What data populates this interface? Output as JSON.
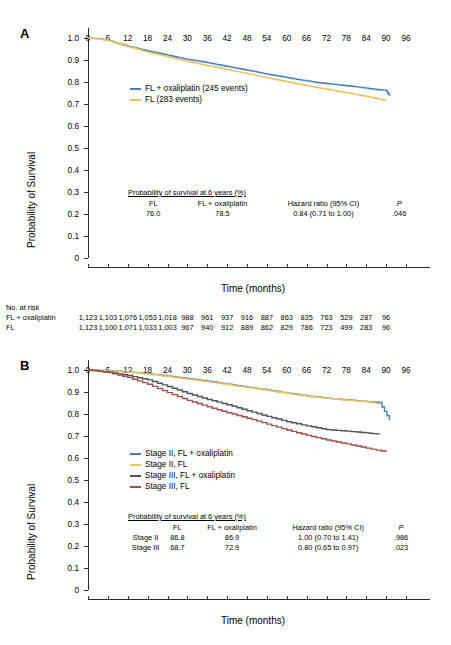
{
  "figure": {
    "panels": [
      "A",
      "B"
    ],
    "axis_title_x": "Time (months)",
    "axis_title_y": "Probability of Survival",
    "x_ticks": [
      0,
      6,
      12,
      18,
      24,
      30,
      36,
      42,
      48,
      54,
      60,
      66,
      72,
      78,
      84,
      90,
      96
    ],
    "y_ticks": [
      "0",
      "0.1",
      "0.2",
      "0.3",
      "0.4",
      "0.5",
      "0.6",
      "0.7",
      "0.8",
      "0.9",
      "1.0"
    ],
    "colors": {
      "blue": "#4a7ebb",
      "gold": "#e7c košice",
      "gold_fix": "#e8c55a",
      "slate": "#4a5560",
      "brick": "#a0504a"
    }
  },
  "panelA": {
    "letter": "A",
    "legend": [
      {
        "label": "FL + oxaliplatin (245 events)",
        "color": "#4a7ebb"
      },
      {
        "label": "FL (283 events)",
        "color": "#e8c55a"
      }
    ],
    "stats": {
      "title": "Probability of survival at 6 years (%)",
      "headers": [
        "FL",
        "FL + oxaliplatin",
        "Hazard ratio (95% CI)",
        "P"
      ],
      "rows": [
        [
          "76.0",
          "78.5",
          "0.84 (0.71 to 1.00)",
          ".046"
        ]
      ]
    }
  },
  "at_risk": {
    "title": "No. at risk",
    "rows": [
      {
        "label": "FL + oxaliplatin",
        "values": [
          "1,123",
          "1,103",
          "1,076",
          "1,053",
          "1,018",
          "988",
          "961",
          "937",
          "916",
          "887",
          "863",
          "835",
          "763",
          "529",
          "287",
          "96"
        ]
      },
      {
        "label": "FL",
        "values": [
          "1,123",
          "1,100",
          "1,071",
          "1,033",
          "1,003",
          "967",
          "940",
          "912",
          "889",
          "862",
          "829",
          "786",
          "723",
          "499",
          "283",
          "96"
        ]
      }
    ]
  },
  "panelB": {
    "letter": "B",
    "legend": [
      {
        "label": "Stage II, FL + oxaliplatin",
        "color": "#4a7ebb"
      },
      {
        "label": "Stage II, FL",
        "color": "#e8c55a"
      },
      {
        "label": "Stage III, FL + oxaliplatin",
        "color": "#4a5560"
      },
      {
        "label": "Stage III, FL",
        "color": "#a0504a"
      }
    ],
    "stats": {
      "title": "Probability of survival at 6 years (%)",
      "headers": [
        "",
        "FL",
        "FL + oxaliplatin",
        "Hazard ratio (95% CI)",
        "P"
      ],
      "rows": [
        [
          "Stage II",
          "86.8",
          "86.9",
          "1.00 (0.70 to 1.41)",
          ".986"
        ],
        [
          "Stage III",
          "68.7",
          "72.9",
          "0.80 (0.65 to 0.97)",
          ".023"
        ]
      ]
    }
  },
  "chart_data": [
    {
      "type": "line",
      "panel": "A",
      "title": "",
      "xlabel": "Time (months)",
      "ylabel": "Probability of Survival",
      "xlim": [
        0,
        96
      ],
      "ylim": [
        0,
        1.0
      ],
      "grid": false,
      "legend_position": "inside-upper-left",
      "series": [
        {
          "name": "FL + oxaliplatin (245 events)",
          "color": "#4a7ebb",
          "events": 245,
          "survival_6y": 78.5,
          "x": [
            0,
            3,
            6,
            9,
            12,
            15,
            18,
            21,
            24,
            27,
            30,
            33,
            36,
            39,
            42,
            45,
            48,
            51,
            54,
            57,
            60,
            63,
            66,
            69,
            72,
            75,
            78,
            81,
            84,
            87,
            90,
            91
          ],
          "y": [
            1.0,
            0.997,
            0.99,
            0.975,
            0.963,
            0.952,
            0.941,
            0.932,
            0.922,
            0.912,
            0.903,
            0.896,
            0.888,
            0.879,
            0.871,
            0.862,
            0.854,
            0.845,
            0.836,
            0.828,
            0.82,
            0.812,
            0.805,
            0.798,
            0.793,
            0.788,
            0.783,
            0.778,
            0.772,
            0.766,
            0.762,
            0.738
          ]
        },
        {
          "name": "FL (283 events)",
          "color": "#e8c55a",
          "events": 283,
          "survival_6y": 76.0,
          "x": [
            0,
            3,
            6,
            9,
            12,
            15,
            18,
            21,
            24,
            27,
            30,
            33,
            36,
            39,
            42,
            45,
            48,
            51,
            54,
            57,
            60,
            63,
            66,
            69,
            72,
            75,
            78,
            81,
            84,
            87,
            90
          ],
          "y": [
            1.0,
            0.996,
            0.989,
            0.974,
            0.961,
            0.948,
            0.935,
            0.925,
            0.915,
            0.903,
            0.893,
            0.884,
            0.874,
            0.866,
            0.857,
            0.847,
            0.838,
            0.829,
            0.82,
            0.81,
            0.801,
            0.792,
            0.783,
            0.775,
            0.767,
            0.759,
            0.751,
            0.743,
            0.734,
            0.725,
            0.715
          ]
        }
      ],
      "annotations": {
        "stats_title": "Probability of survival at 6 years (%)",
        "hazard_ratio": "0.84 (0.71 to 1.00)",
        "p_value": ".046"
      }
    },
    {
      "type": "line",
      "panel": "B",
      "title": "",
      "xlabel": "Time (months)",
      "ylabel": "Probability of Survival",
      "xlim": [
        0,
        96
      ],
      "ylim": [
        0,
        1.0
      ],
      "grid": false,
      "legend_position": "inside-middle-left",
      "series": [
        {
          "name": "Stage II, FL + oxaliplatin",
          "color": "#4a7ebb",
          "survival_6y": 86.9,
          "x": [
            0,
            6,
            12,
            18,
            24,
            30,
            36,
            42,
            48,
            54,
            60,
            66,
            72,
            78,
            84,
            88,
            91
          ],
          "y": [
            1.0,
            0.997,
            0.991,
            0.983,
            0.972,
            0.961,
            0.949,
            0.936,
            0.922,
            0.909,
            0.895,
            0.882,
            0.872,
            0.864,
            0.857,
            0.852,
            0.772
          ]
        },
        {
          "name": "Stage II, FL",
          "color": "#e8c55a",
          "survival_6y": 86.8,
          "x": [
            0,
            6,
            12,
            18,
            24,
            30,
            36,
            42,
            48,
            54,
            60,
            66,
            72,
            78,
            84,
            88
          ],
          "y": [
            1.0,
            0.996,
            0.99,
            0.981,
            0.97,
            0.958,
            0.946,
            0.933,
            0.92,
            0.907,
            0.893,
            0.881,
            0.871,
            0.863,
            0.856,
            0.846
          ]
        },
        {
          "name": "Stage III, FL + oxaliplatin",
          "color": "#4a5560",
          "survival_6y": 72.9,
          "x": [
            0,
            6,
            12,
            18,
            24,
            30,
            36,
            42,
            48,
            54,
            60,
            66,
            72,
            78,
            84,
            88
          ],
          "y": [
            1.0,
            0.99,
            0.975,
            0.955,
            0.925,
            0.893,
            0.866,
            0.842,
            0.815,
            0.789,
            0.765,
            0.746,
            0.729,
            0.722,
            0.714,
            0.708
          ]
        },
        {
          "name": "Stage III, FL",
          "color": "#a0504a",
          "survival_6y": 68.7,
          "x": [
            0,
            6,
            12,
            18,
            24,
            30,
            36,
            42,
            48,
            54,
            60,
            66,
            72,
            78,
            84,
            90
          ],
          "y": [
            1.0,
            0.988,
            0.966,
            0.935,
            0.897,
            0.862,
            0.833,
            0.806,
            0.781,
            0.754,
            0.727,
            0.703,
            0.682,
            0.664,
            0.645,
            0.627
          ]
        }
      ],
      "annotations": {
        "stats_title": "Probability of survival at 6 years (%)",
        "stage_ii_hr": "1.00 (0.70 to 1.41)",
        "stage_ii_p": ".986",
        "stage_iii_hr": "0.80 (0.65 to 0.97)",
        "stage_iii_p": ".023"
      }
    }
  ]
}
